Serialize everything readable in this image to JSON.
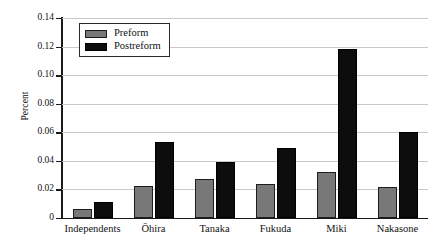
{
  "chart_data": {
    "type": "bar",
    "title": "",
    "xlabel": "",
    "ylabel": "Percent",
    "ylim": [
      0,
      0.14
    ],
    "ytick_values": [
      0,
      0.02,
      0.04,
      0.06,
      0.08,
      0.1,
      0.12,
      0.14
    ],
    "ytick_labels": [
      "0",
      "0.02",
      "0.04",
      "0.06",
      "0.08",
      "0.10",
      "0.12",
      "0.14"
    ],
    "grid": true,
    "legend_position": "upper-left-inside",
    "categories": [
      "Independents",
      "Ōhira",
      "Tanaka",
      "Fukuda",
      "Miki",
      "Nakasone"
    ],
    "series": [
      {
        "name": "Preform",
        "color": "#787878",
        "values": [
          0.006,
          0.0225,
          0.0275,
          0.0235,
          0.032,
          0.022
        ]
      },
      {
        "name": "Postreform",
        "color": "#0d0d0d",
        "values": [
          0.0115,
          0.053,
          0.039,
          0.049,
          0.118,
          0.06
        ]
      }
    ]
  },
  "legend": {
    "entries": [
      {
        "label": "Preform",
        "swatch": "gray-swatch"
      },
      {
        "label": "Postreform",
        "swatch": "black-swatch"
      }
    ]
  }
}
